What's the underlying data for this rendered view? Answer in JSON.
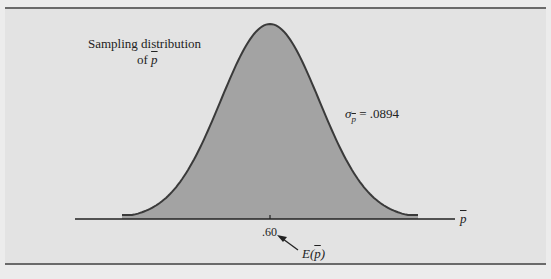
{
  "chart_data": {
    "type": "area",
    "title_line1": "Sampling distribution",
    "title_line2_prefix": "of ",
    "title_line2_var": "p",
    "distribution": "normal",
    "mean": 0.6,
    "std_error": 0.0894,
    "xlabel_var": "p",
    "xlabel": "p̄",
    "ylabel": "",
    "x_ticks": [
      ".60"
    ],
    "annotations": [
      {
        "text_sigma": "σ",
        "text_sub": "p̄",
        "text_value": " = .0894",
        "label": "σp̄ = .0894"
      },
      {
        "text_prefix": "E(",
        "text_var": "p",
        "text_suffix": ")",
        "label": "E(p̄)",
        "points_to": ".60"
      }
    ],
    "grid": false,
    "fill_color": "#a3a3a3",
    "background_color": "#e3e3e3"
  }
}
